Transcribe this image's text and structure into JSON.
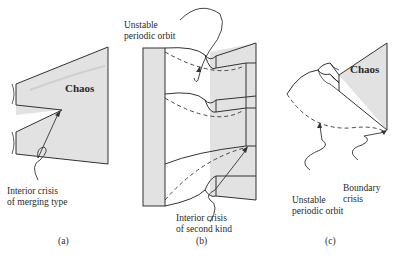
{
  "panels": [
    {
      "id": "a",
      "caption": "(a)",
      "region_label": "Chaos",
      "annotation": [
        "Interior crisis",
        "of merging type"
      ]
    },
    {
      "id": "b",
      "caption": "(b)",
      "annotation_top": [
        "Unstable",
        "periodic orbit"
      ],
      "annotation_bottom": [
        "Interior crisis",
        "of second kind"
      ]
    },
    {
      "id": "c",
      "caption": "(c)",
      "region_label": "Chaos",
      "annotation_left": [
        "Unstable",
        "periodic orbit"
      ],
      "annotation_right": [
        "Boundary",
        "crisis"
      ]
    }
  ],
  "colors": {
    "shade": "#e2e2e2",
    "line": "#333333",
    "background": "#ffffff"
  }
}
